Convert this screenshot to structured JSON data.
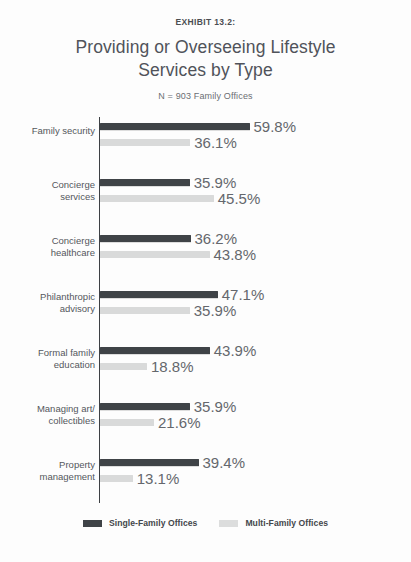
{
  "header": {
    "exhibit_label": "EXHIBIT 13.2:",
    "title_line1": "Providing or Overseeing Lifestyle",
    "title_line2": "Services by Type",
    "subtitle": "N = 903 Family Offices"
  },
  "legend": {
    "items": [
      {
        "label": "Single-Family Offices",
        "color": "#3f4347",
        "key": "sfo"
      },
      {
        "label": "Multi-Family Offices",
        "color": "#dcdddd",
        "key": "mfo"
      }
    ]
  },
  "chart_data": {
    "type": "bar",
    "orientation": "horizontal",
    "title": "Providing or Overseeing Lifestyle Services by Type",
    "subtitle": "N = 903 Family Offices",
    "exhibit": "EXHIBIT 13.2:",
    "xlabel": "",
    "ylabel": "",
    "xlim": [
      0,
      100
    ],
    "grid": false,
    "legend_position": "bottom",
    "value_suffix": "%",
    "px_per_percent": 2.5,
    "categories": [
      "Family security",
      "Concierge services",
      "Concierge healthcare",
      "Philanthropic advisory",
      "Formal family education",
      "Managing art/ collectibles",
      "Property management"
    ],
    "category_lines": [
      [
        "Family security"
      ],
      [
        "Concierge",
        "services"
      ],
      [
        "Concierge",
        "healthcare"
      ],
      [
        "Philanthropic",
        "advisory"
      ],
      [
        "Formal family",
        "education"
      ],
      [
        "Managing art/",
        "collectibles"
      ],
      [
        "Property",
        "management"
      ]
    ],
    "series": [
      {
        "name": "Single-Family Offices",
        "color": "#3f4347",
        "values": [
          59.8,
          35.9,
          36.2,
          47.1,
          43.9,
          35.9,
          39.4
        ],
        "labels": [
          "59.8%",
          "35.9%",
          "36.2%",
          "47.1%",
          "43.9%",
          "35.9%",
          "39.4%"
        ]
      },
      {
        "name": "Multi-Family Offices",
        "color": "#d9dada",
        "values": [
          36.1,
          45.5,
          43.8,
          35.9,
          18.8,
          21.6,
          13.1
        ],
        "labels": [
          "36.1%",
          "45.5%",
          "43.8%",
          "35.9%",
          "18.8%",
          "21.6%",
          "13.1%"
        ]
      }
    ]
  }
}
